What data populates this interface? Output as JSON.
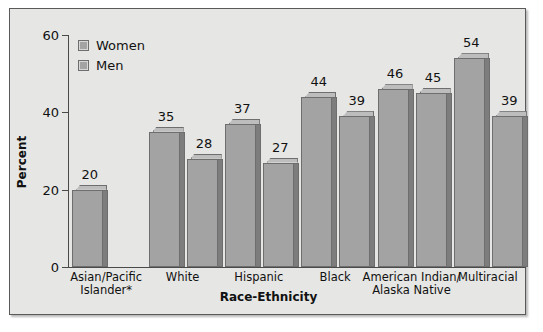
{
  "chart_data": {
    "type": "bar",
    "title": "",
    "xlabel": "Race-Ethnicity",
    "ylabel": "Percent",
    "ylim": [
      0,
      60
    ],
    "yticks": [
      0,
      20,
      40,
      60
    ],
    "grid": false,
    "legend_position": "top-left",
    "categories": [
      "Asian/Pacific Islander*",
      "White",
      "Hispanic",
      "Black",
      "American Indian/ Alaska Native",
      "Multiracial"
    ],
    "category_lines": [
      [
        "Asian/Pacific",
        "Islander*"
      ],
      [
        "White"
      ],
      [
        "Hispanic"
      ],
      [
        "Black"
      ],
      [
        "American Indian/",
        "Alaska Native"
      ],
      [
        "Multiracial"
      ]
    ],
    "series": [
      {
        "name": "Women",
        "values": [
          20,
          35,
          37,
          44,
          46,
          54
        ]
      },
      {
        "name": "Men",
        "values": [
          null,
          28,
          27,
          39,
          45,
          39
        ]
      }
    ],
    "colors": {
      "bar_face": "#a3a3a3",
      "bar_top": "#bdbdbd",
      "bar_side": "#7d7d7d",
      "bar_edge": "#6e6e6e",
      "panel": "#e6e6e4",
      "axis": "#4a4a4a",
      "text": "#111111"
    }
  },
  "legend": {
    "items": [
      {
        "label": "Women"
      },
      {
        "label": "Men"
      }
    ]
  },
  "axis": {
    "y_tick_labels": [
      "60",
      "40",
      "20",
      "0"
    ],
    "y_title": "Percent",
    "x_title": "Race-Ethnicity"
  }
}
